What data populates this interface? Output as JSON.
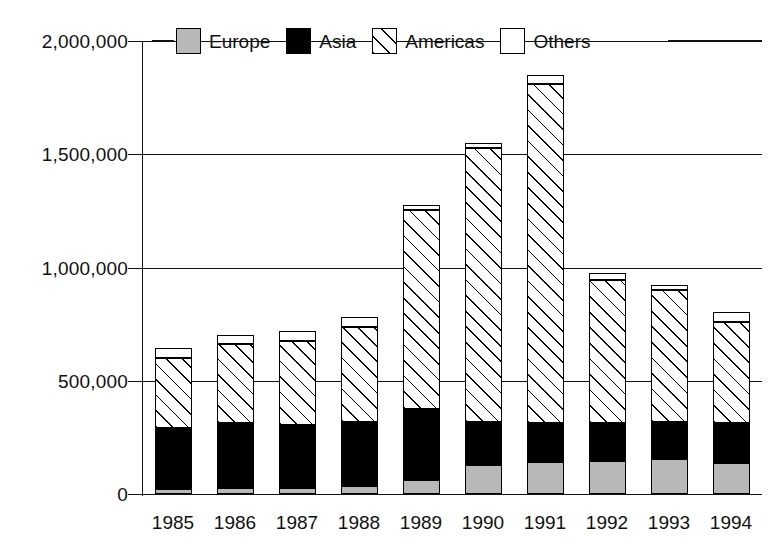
{
  "chart_data": {
    "type": "bar",
    "subtype": "stacked-vertical",
    "title": "",
    "subtitle": "",
    "xlabel": "",
    "ylabel": "",
    "categories": [
      "1985",
      "1986",
      "1987",
      "1988",
      "1989",
      "1990",
      "1991",
      "1992",
      "1993",
      "1994"
    ],
    "series": [
      {
        "name": "Europe",
        "values": [
          22000,
          26000,
          26000,
          35000,
          62000,
          128000,
          141000,
          146000,
          155000,
          137000
        ]
      },
      {
        "name": "Asia",
        "values": [
          269000,
          286000,
          278000,
          282000,
          313000,
          190000,
          172000,
          168000,
          163000,
          176000
        ]
      },
      {
        "name": "Americas",
        "values": [
          309000,
          349000,
          371000,
          421000,
          877000,
          1208000,
          1497000,
          632000,
          581000,
          446000
        ]
      },
      {
        "name": "Others",
        "values": [
          45000,
          40000,
          44000,
          44000,
          22000,
          22000,
          40000,
          31000,
          22000,
          44000
        ]
      }
    ],
    "totals": [
      645000,
      701000,
      719000,
      782000,
      1274000,
      1548000,
      1850000,
      977000,
      921000,
      803000
    ],
    "ylim": [
      0,
      2000000
    ],
    "yticks": [
      0,
      500000,
      1000000,
      1500000,
      2000000
    ],
    "ytick_labels": [
      "0",
      "500,000",
      "1,000,000",
      "1,500,000",
      "2,000,000"
    ],
    "grid": true,
    "grid_axis": "y",
    "legend_position": "top",
    "legend": [
      {
        "label": "Europe",
        "swatch": "solid-gray",
        "color": "#b8b8b8"
      },
      {
        "label": "Asia",
        "swatch": "solid-black",
        "color": "#000000"
      },
      {
        "label": "Americas",
        "swatch": "diagonal-hatch",
        "color": "#ffffff"
      },
      {
        "label": "Others",
        "swatch": "solid-white",
        "color": "#ffffff"
      }
    ],
    "colors": {
      "europe": "#b8b8b8",
      "asia": "#000000",
      "americas": "#ffffff",
      "others": "#ffffff",
      "axis": "#111111",
      "background": "#ffffff"
    }
  },
  "axes": {
    "y_labels": [
      "2,000,000",
      "1,500,000",
      "1,000,000",
      "500,000",
      "0"
    ],
    "x_labels": [
      "1985",
      "1986",
      "1987",
      "1988",
      "1989",
      "1990",
      "1991",
      "1992",
      "1993",
      "1994"
    ]
  },
  "legend_labels": {
    "europe": "Europe",
    "asia": "Asia",
    "americas": "Americas",
    "others": "Others"
  }
}
